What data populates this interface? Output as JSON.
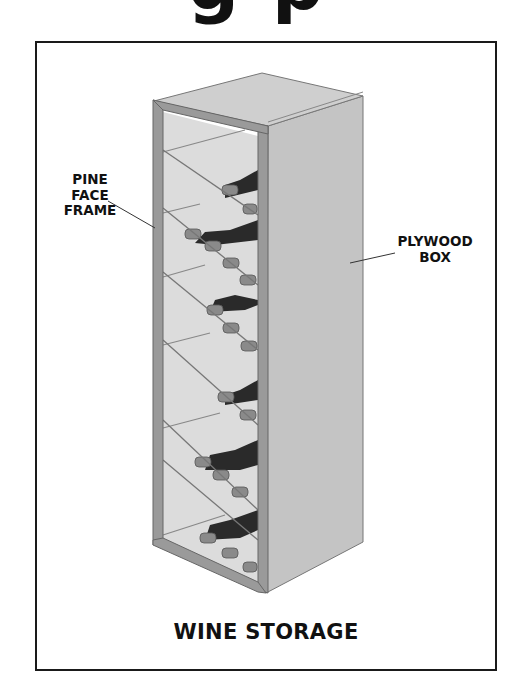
{
  "page": {
    "clipped_heading": "g p"
  },
  "figure": {
    "caption": "WINE STORAGE",
    "labels": {
      "pine_face_frame": [
        "PINE",
        "FACE",
        "FRAME"
      ],
      "plywood_box": [
        "PLYWOOD",
        "BOX"
      ]
    },
    "cabinet": {
      "shelves": 7,
      "diagonal_dividers": 6
    },
    "colors": {
      "border": "#1a1a1a",
      "plywood_side": "#c4c4c4",
      "plywood_top": "#cfcfcf",
      "face_frame": "#9a9a9a",
      "bottle": "#2a2a2a",
      "interior": "#dcdcdc"
    }
  }
}
